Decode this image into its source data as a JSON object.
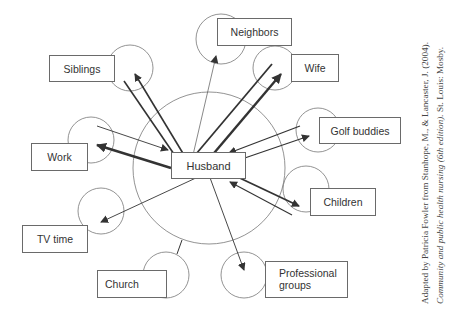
{
  "diagram": {
    "type": "ecomap",
    "center": {
      "label": "Husband"
    },
    "nodes": [
      {
        "id": "neighbors",
        "label": "Neighbors",
        "relation": "weak, outgoing from husband"
      },
      {
        "id": "siblings",
        "label": "Siblings",
        "relation": "strong, bidirectional"
      },
      {
        "id": "wife",
        "label": "Wife",
        "relation": "strong, bidirectional"
      },
      {
        "id": "golf",
        "label": "Golf buddies",
        "relation": "bidirectional"
      },
      {
        "id": "work",
        "label": "Work",
        "relation": "bidirectional, stronger toward work"
      },
      {
        "id": "children",
        "label": "Children",
        "relation": "bidirectional"
      },
      {
        "id": "tv",
        "label": "TV time",
        "relation": "outgoing from husband"
      },
      {
        "id": "church",
        "label": "Church",
        "relation": "connected, no flow"
      },
      {
        "id": "professional",
        "label": "Professional groups",
        "label_lines": [
          "Professional",
          "groups"
        ],
        "relation": "outgoing from husband"
      }
    ]
  },
  "citation": {
    "line1": "Adapted by Patricia Fowler from Stanhope, M., & Lancaster, J. (2004).",
    "line2_italic": "Community and public health nursing (6th edition).",
    "line2_rest": " St. Louis: Mosby."
  },
  "colors": {
    "line": "#333333",
    "box_border": "#6a6a6a",
    "circle": "#777777"
  }
}
